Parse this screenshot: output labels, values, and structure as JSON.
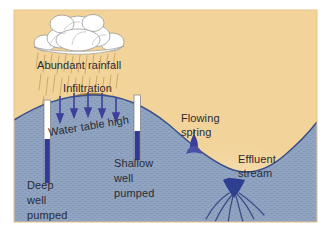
{
  "figure": {
    "frame": {
      "margin_color": "#ffffff",
      "sky_color": "#f2d49b",
      "border_color": "#e8c98c"
    },
    "colors": {
      "sky": "#f2d49b",
      "sky_glow": "#fdfaf0",
      "soil_unsaturated": "#c9a567",
      "soil_surface_band": "#a9823f",
      "aquifer_water": "#8ea2c0",
      "aquifer_stipple": "#6f86aa",
      "water_table_line": "#3a4f8a",
      "well_casing": "#ffffff",
      "well_water": "#2e3a96",
      "arrow": "#3f3f9b",
      "rain_streak": "#c8a964",
      "cloud_fill": "#ffffff",
      "cloud_outline": "#8c8c8c",
      "label_text": "#2b2b33",
      "stream_channel": "#2f3f8f",
      "flow_line": "#3a4a86"
    },
    "labels": {
      "rainfall": "Abundant rainfall",
      "infiltration": "Infiltration",
      "water_table": "Water table high",
      "deep_well_line1": "Deep",
      "deep_well_line2": "well",
      "deep_well_line3": "pumped",
      "shallow_well_line1": "Shallow",
      "shallow_well_line2": "well",
      "shallow_well_line3": "pumped",
      "spring_line1": "Flowing",
      "spring_line2": "spring",
      "stream_line1": "Effluent",
      "stream_line2": "stream"
    },
    "features": {
      "cloud": "cumulus-cloud",
      "rain": "rain-streaks",
      "infiltration_arrows": 5,
      "deep_well": "deep-well-pumped",
      "shallow_well": "shallow-well-pumped",
      "spring": "flowing-spring",
      "stream": "effluent-stream",
      "flow_lines": 6
    }
  }
}
